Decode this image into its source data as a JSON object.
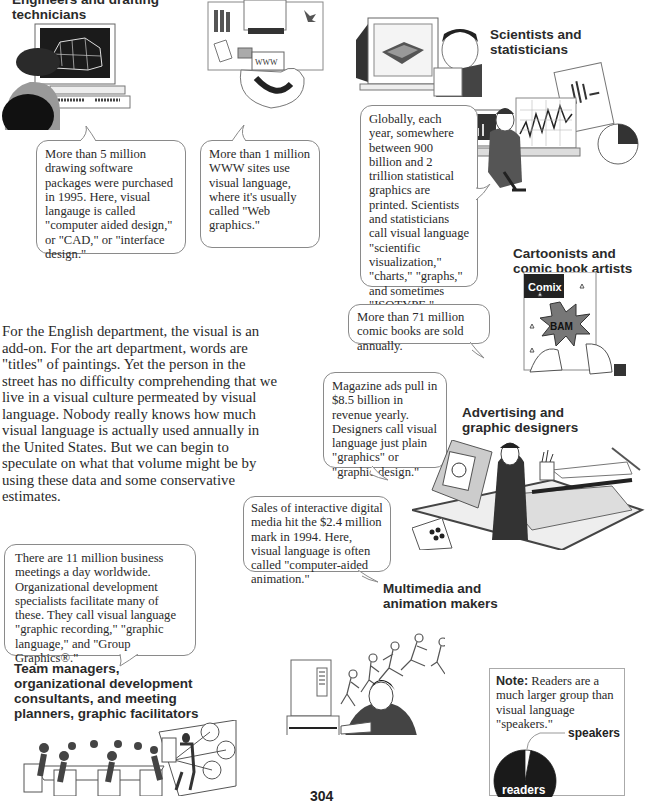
{
  "page_number": "304",
  "intro_paragraph": "For the English department, the visual is an add-on.  For the art department, words are \"titles\" of paintings.  Yet the person in the street has no difficulty comprehending that we live in a visual culture permeated by visual language.  Nobody really knows how much visual language is actually used annually in the United States.  But we can begin to speculate on what that volume might be by using these data and some conservative estimates.",
  "groups": {
    "engineers": {
      "heading": "Engineers and drafting technicians",
      "bubble": "More than 5 million drawing software packages were purchased in 1995. Here, visual langauge is called \"computer aided design,\" or \"CAD,\" or \"interface design.\""
    },
    "web": {
      "screen_label": "WWW",
      "bubble": "More than 1 million WWW sites use visual language, where it's usually called \"Web graphics.\""
    },
    "scientists": {
      "heading": "Scientists and statisticians",
      "bubble": "Globally, each year, somewhere between 900 billion and 2 trillion statistical graphics are printed. Scientists and statisticians call visual language \"scientific visualization,\" \"charts,\" \"graphs,\" and sometimes \"ISOTYPE.\""
    },
    "cartoonists": {
      "heading": "Cartoonists and comic book artists",
      "comic_title": "Comix",
      "comic_burst": "BAM",
      "bubble": "More than 71 million comic books are sold annually."
    },
    "advertising": {
      "heading": "Advertising and graphic designers",
      "bubble": "Magazine ads pull in $8.5 billion in revenue yearly.  Designers call visual language just plain \"graphics\" or \"graphic design.\""
    },
    "multimedia": {
      "heading": "Multimedia and animation makers",
      "bubble": "Sales of interactive digital media hit the $2.4 million mark in 1994.  Here, visual language is often called \"computer-aided animation.\""
    },
    "team": {
      "heading": "Team managers, organizational development consultants, and meeting planners,  graphic facilitators",
      "bubble": "There are 11 million business meetings a day worldwide. Organizational development specialists facilitate many of these. They call visual language \"graphic recording,\" \"graphic language,\" and \"Group Graphics®.\""
    }
  },
  "note": {
    "label": "Note:",
    "text": " Readers are a much larger group than visual language \"speakers.\""
  },
  "chart_data": {
    "type": "pie",
    "title": "",
    "categories": [
      "readers",
      "speakers"
    ],
    "values": [
      97,
      3
    ],
    "colors": [
      "#1a1a1a",
      "#ffffff"
    ],
    "labels": [
      "readers",
      "speakers"
    ]
  }
}
